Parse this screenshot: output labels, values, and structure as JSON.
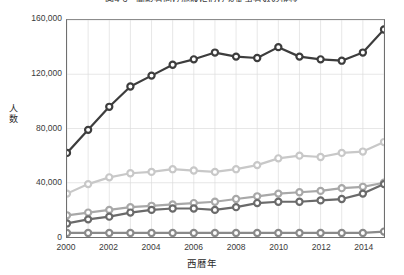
{
  "chart_data": {
    "type": "line",
    "title": "図4-6　高齢者向け施設における従事者数の推移",
    "xlabel": "西暦年",
    "ylabel": "人数",
    "x": [
      2000,
      2001,
      2002,
      2003,
      2004,
      2005,
      2006,
      2007,
      2008,
      2009,
      2010,
      2011,
      2012,
      2013,
      2014,
      2015
    ],
    "xlim": [
      2000,
      2015
    ],
    "ylim": [
      0,
      160000
    ],
    "yticks": [
      0,
      40000,
      80000,
      120000,
      160000
    ],
    "ytick_labels": [
      "0",
      "40,000",
      "80,000",
      "120,000",
      "160,000"
    ],
    "xtick_values": [
      2000,
      2002,
      2004,
      2006,
      2008,
      2010,
      2012,
      2014
    ],
    "xtick_labels": [
      "2000",
      "2002",
      "2004",
      "2006",
      "2008",
      "2010",
      "2012",
      "2014"
    ],
    "grid": true,
    "legend": "none",
    "marker": "open-circle",
    "series": [
      {
        "name": "series-1",
        "color": "#3d3d3d",
        "values": [
          62000,
          79000,
          96000,
          111000,
          119000,
          127000,
          131000,
          136000,
          133000,
          132000,
          140000,
          133000,
          131000,
          130000,
          136000,
          153000
        ]
      },
      {
        "name": "series-2",
        "color": "#c8c8c8",
        "values": [
          32000,
          39000,
          44000,
          47000,
          48000,
          50000,
          49000,
          48000,
          50000,
          53000,
          58000,
          60000,
          59000,
          62000,
          63000,
          70000
        ]
      },
      {
        "name": "series-3",
        "color": "#a8a8a8",
        "values": [
          16000,
          18000,
          20000,
          22000,
          23000,
          24000,
          25000,
          26000,
          28000,
          30000,
          32000,
          33000,
          34000,
          36000,
          37000,
          40000
        ]
      },
      {
        "name": "series-4",
        "color": "#6a6a6a",
        "values": [
          10000,
          13000,
          15000,
          18000,
          20000,
          21000,
          21000,
          20000,
          22000,
          25000,
          26000,
          26000,
          27000,
          28000,
          32000,
          39000
        ]
      },
      {
        "name": "series-5",
        "color": "#8a8a8a",
        "values": [
          3000,
          3000,
          3000,
          3000,
          3000,
          3000,
          3000,
          3000,
          3000,
          3000,
          3000,
          3000,
          3000,
          3000,
          3000,
          4000
        ]
      }
    ]
  }
}
